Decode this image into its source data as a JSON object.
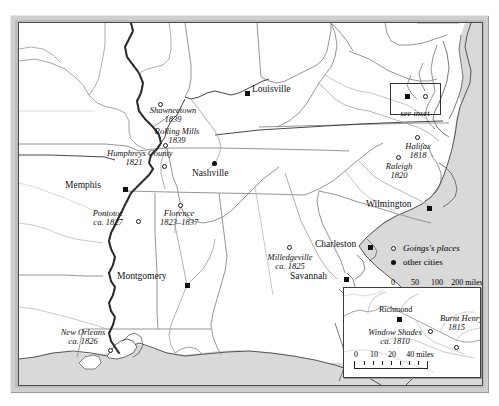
{
  "map": {
    "title": "Goings's places map",
    "colors": {
      "water": "#d9d9d9",
      "land": "#ffffff",
      "border": "#7a7a7a",
      "river": "#3a3a3a",
      "frame": "#cfcfcf",
      "ink": "#111111"
    },
    "see_inset_label": "see inset",
    "goings_places": [
      {
        "name": "Shawneetown",
        "date": "1839",
        "x": 142,
        "y": 82,
        "lx": 143,
        "ly": 85,
        "anchor": "center"
      },
      {
        "name": "Rolling Mills",
        "date": "1839",
        "x": 148,
        "y": 122,
        "lx": 157,
        "ly": 109,
        "anchor": "center"
      },
      {
        "name": "Humphreys County",
        "date": "1821",
        "x": 147,
        "y": 142,
        "lx": 116,
        "ly": 130,
        "anchor": "center"
      },
      {
        "name": "Pontotoc",
        "date": "ca. 1827",
        "x": 120,
        "y": 198,
        "lx": 90,
        "ly": 188,
        "anchor": "center"
      },
      {
        "name": "Florence",
        "date": "1823–1837",
        "x": 161,
        "y": 184,
        "lx": 147,
        "ly": 187,
        "anchor": "center"
      },
      {
        "name": "Milledgeville",
        "date": "ca. 1825",
        "x": 270,
        "y": 228,
        "lx": 244,
        "ly": 233,
        "anchor": "center"
      },
      {
        "name": "Raleigh",
        "date": "1820",
        "x": 379,
        "y": 137,
        "lx": 366,
        "ly": 141,
        "anchor": "center"
      },
      {
        "name": "Halifax",
        "date": "1818",
        "x": 398,
        "y": 117,
        "lx": 385,
        "ly": 121,
        "anchor": "center"
      },
      {
        "name": "New Orleans",
        "date": "ca. 1826",
        "x": 91,
        "y": 327,
        "lx": 58,
        "ly": 313,
        "anchor": "center"
      }
    ],
    "other_cities": [
      {
        "name": "Louisville",
        "x": 228,
        "y": 70,
        "lx": 233,
        "ly": 64
      },
      {
        "name": "Nashville",
        "x": 195,
        "y": 140,
        "lx": 172,
        "ly": 142
      },
      {
        "name": "Memphis",
        "x": 106,
        "y": 167,
        "lx": 58,
        "ly": 158
      },
      {
        "name": "Montgomery",
        "x": 168,
        "y": 262,
        "lx": 110,
        "ly": 252
      },
      {
        "name": "Charleston",
        "x": 351,
        "y": 224,
        "lx": 312,
        "ly": 221
      },
      {
        "name": "Savannah",
        "x": 327,
        "y": 256,
        "lx": 283,
        "ly": 256
      },
      {
        "name": "Wilmington",
        "x": 410,
        "y": 185,
        "lx": 363,
        "ly": 179
      }
    ],
    "legend": {
      "items": [
        {
          "symbol": "hollow-circle",
          "label": "Goings's places",
          "italic": true
        },
        {
          "symbol": "solid-circle",
          "label": "other cities",
          "italic": false
        }
      ],
      "scale": {
        "ticks": [
          "0",
          "50",
          "100",
          "200"
        ],
        "tick_positions": [
          0,
          22,
          44,
          88
        ],
        "unit_label": "200 miles",
        "width": 88,
        "minor_divisions": 8
      }
    }
  },
  "inset": {
    "goings_places": [
      {
        "name": "Window Shades",
        "date": "ca. 1810",
        "x": 86,
        "y": 43,
        "lx": 22,
        "ly": 41
      },
      {
        "name": "Burnt Henry",
        "date": "1815",
        "x": 112,
        "y": 59,
        "lx": 97,
        "ly": 30
      }
    ],
    "other_cities": [
      {
        "name": "Richmond",
        "x": 55,
        "y": 31,
        "lx": 36,
        "ly": 19
      }
    ],
    "scale": {
      "ticks": [
        "0",
        "10",
        "20",
        "40"
      ],
      "tick_positions": [
        0,
        18,
        36,
        72
      ],
      "unit_label": "40 miles",
      "width": 72,
      "minor_divisions": 8
    }
  }
}
